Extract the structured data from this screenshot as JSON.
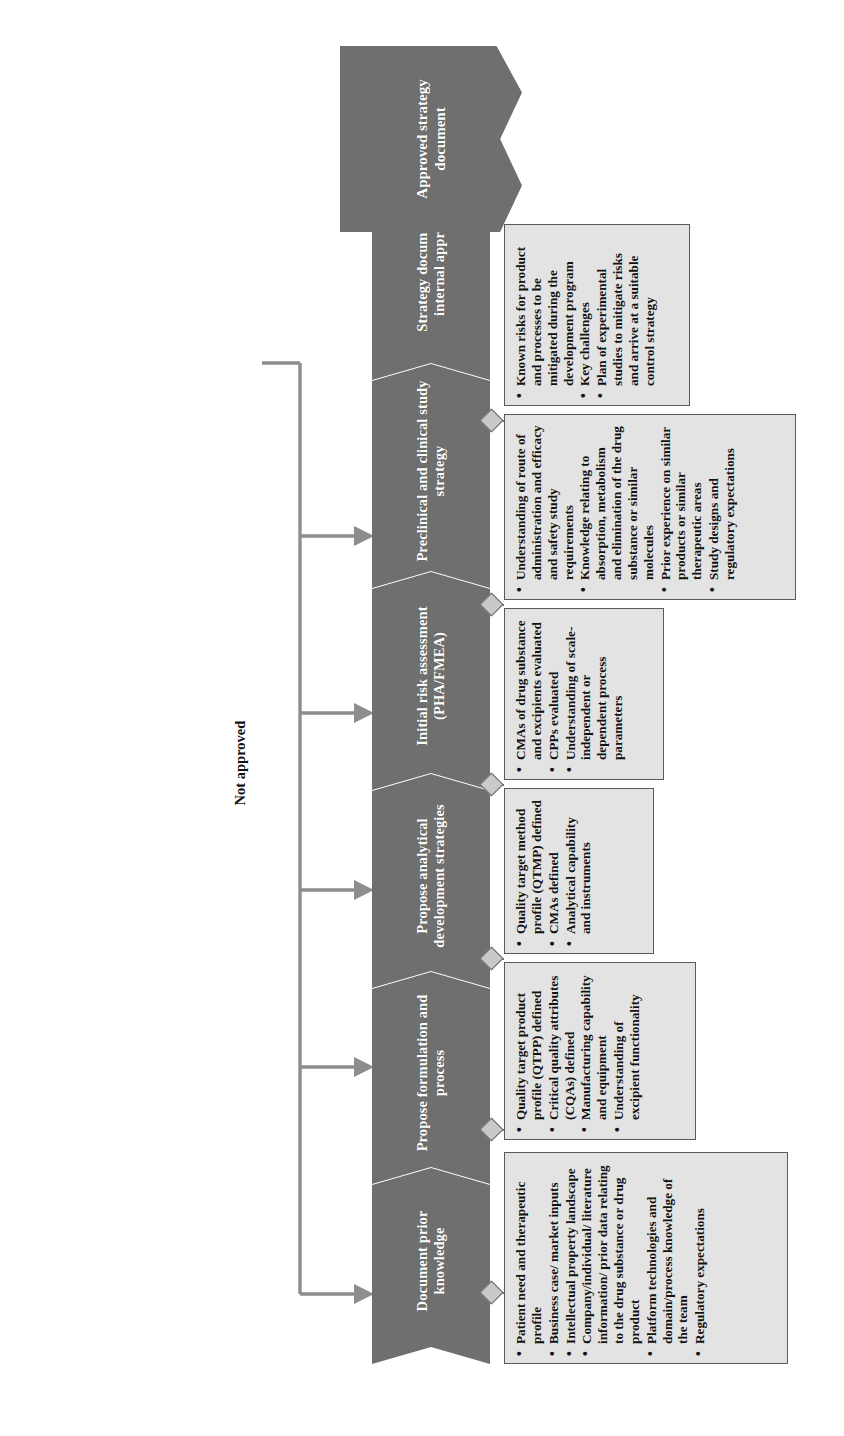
{
  "diagram": {
    "final_output": {
      "label": "Approved strategy document"
    },
    "feedback": {
      "label": "Not approved"
    },
    "colors": {
      "stage_fill": "#6f6f6f",
      "stage_text": "#ffffff",
      "box_fill": "#e3e3e3",
      "box_border": "#5a5a5a",
      "connector": "#6a6a6a",
      "page_background": "#ffffff"
    },
    "stages": [
      {
        "id": "document-prior-knowledge",
        "label": "Document prior knowledge",
        "bullets": [
          "Patient need and therapeutic profile",
          "Business case/ market inputs",
          "Intellectual property landscape",
          "Company/individual/ literature information/ prior data relating to the drug substance or drug product",
          "Platform technologies and domain/process knowledge of the team",
          "Regulatory expectations"
        ]
      },
      {
        "id": "propose-formulation-and-process",
        "label": "Propose formulation and process",
        "bullets": [
          "Quality target product profile (QTPP) defined",
          "Critical quality attributes (CQAs) defined",
          "Manufacturing capability and equipment",
          "Understanding of excipient functionality"
        ]
      },
      {
        "id": "propose-analytical-development-strategies",
        "label": "Propose analytical development strategies",
        "bullets": [
          "Quality target method profile (QTMP) defined",
          "CMAs defined",
          "Analytical capability and instruments"
        ]
      },
      {
        "id": "initial-risk-assessment",
        "label": "Initial risk assessment (PHA/FMEA)",
        "bullets": [
          "CMAs of drug substance and excipients evaluated",
          "CPPs evaluated",
          "Understanding of scale-independent or dependent process parameters"
        ]
      },
      {
        "id": "preclinical-and-clinical-study-strategy",
        "label": "Preclinical and clinical study strategy",
        "bullets": [
          "Understanding of route of administration and efficacy and safety study requirements",
          "Knowledge relating to absorption, metabolism and elimination of the drug substance or similar molecules",
          "Prior experience on similar products or similar therapeutic areas",
          "Study designs and regulatory expectations"
        ]
      },
      {
        "id": "strategy-document-for-internal-approval",
        "label": "Strategy document for internal approval",
        "bullets": [
          "Known risks for product and processes to be mitigated during the development program",
          "Key challenges",
          "Plan of experimental studies to mitigate risks and arrive at a suitable control strategy"
        ]
      }
    ]
  }
}
